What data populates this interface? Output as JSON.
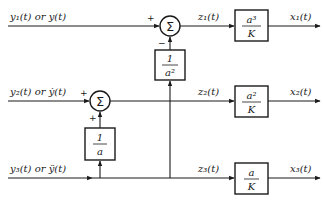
{
  "diagram": {
    "type": "block-diagram",
    "inputs": [
      {
        "id": "y1",
        "label": "y₁(t) or y(t)"
      },
      {
        "id": "y2",
        "label": "y₂(t) or ẏ(t)"
      },
      {
        "id": "y3",
        "label": "y₃(t) or ÿ(t)"
      }
    ],
    "summing_junctions": [
      {
        "id": "sum1",
        "symbol": "Σ",
        "signs": {
          "left": "+",
          "bottom": "−"
        }
      },
      {
        "id": "sum2",
        "symbol": "Σ",
        "signs": {
          "left": "+",
          "bottom": "+"
        }
      }
    ],
    "feedforward_blocks": [
      {
        "id": "inv_a2",
        "numerator": "1",
        "denominator": "a²"
      },
      {
        "id": "inv_a",
        "numerator": "1",
        "denominator": "a"
      }
    ],
    "intermediate_signals": [
      {
        "id": "z1",
        "label": "z₁(t)"
      },
      {
        "id": "z2",
        "label": "z₂(t)"
      },
      {
        "id": "z3",
        "label": "z₃(t)"
      }
    ],
    "gain_blocks": [
      {
        "id": "g1",
        "numerator": "a³",
        "denominator": "K"
      },
      {
        "id": "g2",
        "numerator": "a²",
        "denominator": "K"
      },
      {
        "id": "g3",
        "numerator": "a",
        "denominator": "K"
      }
    ],
    "outputs": [
      {
        "id": "x1",
        "label": "x₁(t)"
      },
      {
        "id": "x2",
        "label": "x₂(t)"
      },
      {
        "id": "x3",
        "label": "x₃(t)"
      }
    ],
    "connections": [
      {
        "from": "y1",
        "to": "sum1",
        "port": "+"
      },
      {
        "from": "y3",
        "to": "inv_a2"
      },
      {
        "from": "inv_a2",
        "to": "sum1",
        "port": "−"
      },
      {
        "from": "sum1",
        "to": "g1",
        "signal": "z1"
      },
      {
        "from": "g1",
        "to": "x1"
      },
      {
        "from": "y2",
        "to": "sum2",
        "port": "+"
      },
      {
        "from": "y3",
        "to": "inv_a"
      },
      {
        "from": "inv_a",
        "to": "sum2",
        "port": "+"
      },
      {
        "from": "sum2",
        "to": "g2",
        "signal": "z2"
      },
      {
        "from": "g2",
        "to": "x2"
      },
      {
        "from": "y3",
        "to": "g3",
        "signal": "z3"
      },
      {
        "from": "g3",
        "to": "x3"
      }
    ]
  }
}
